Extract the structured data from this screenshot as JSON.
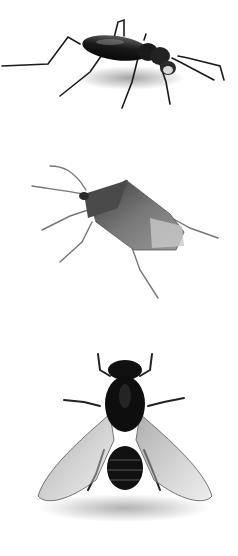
{
  "image": {
    "background": "#ffffff",
    "style": "grayscale illustration",
    "subjects": [
      {
        "id": "beetle",
        "label": "ground beetle",
        "tone": "#151515"
      },
      {
        "id": "bug",
        "label": "stink bug",
        "tone": "#6a6a6a"
      },
      {
        "id": "fly",
        "label": "fly",
        "tone": "#101010"
      }
    ]
  }
}
